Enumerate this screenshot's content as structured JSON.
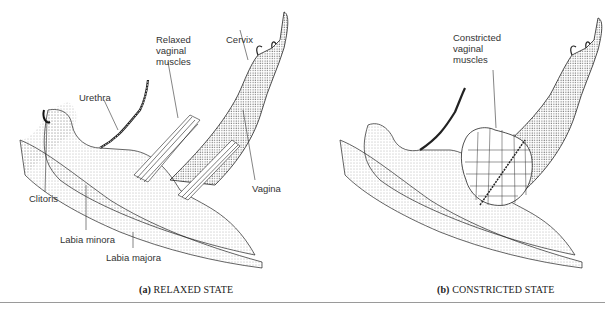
{
  "figure": {
    "panels": [
      {
        "id": "a",
        "caption_letter": "(a)",
        "caption_text": "RELAXED STATE",
        "labels": {
          "relaxed_muscles": "Relaxed\nvaginal\nmuscles",
          "cervix": "Cervix",
          "urethra": "Urethra",
          "vagina": "Vagina",
          "clitoris": "Clitoris",
          "labia_minora": "Labia minora",
          "labia_majora": "Labia majora"
        }
      },
      {
        "id": "b",
        "caption_letter": "(b)",
        "caption_text": "CONSTRICTED STATE",
        "labels": {
          "constricted_muscles": "Constricted\nvaginal\nmuscles"
        }
      }
    ],
    "colors": {
      "ink": "#222222",
      "stipple": "#555555",
      "rule": "#9a9a9a"
    }
  }
}
